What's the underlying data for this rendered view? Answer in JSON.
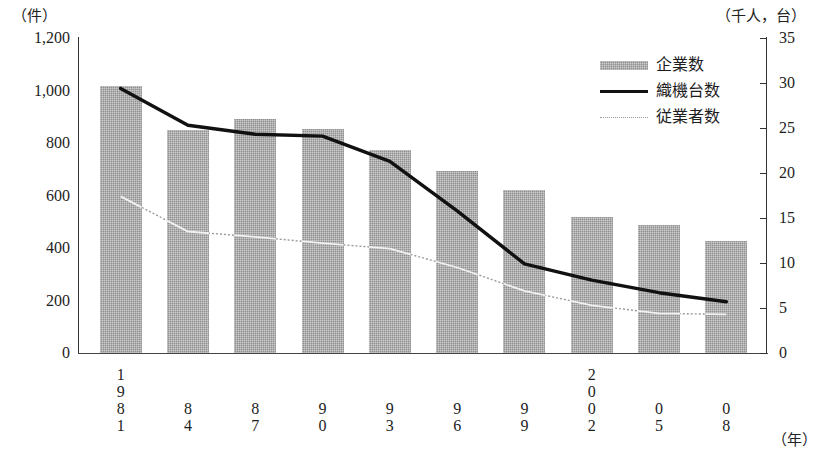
{
  "axes": {
    "left_unit": "（件）",
    "right_unit": "（千人，台）",
    "x_unit": "（年）",
    "left_ticks": [
      "1,200",
      "1,000",
      "800",
      "600",
      "400",
      "200",
      "0"
    ],
    "right_ticks": [
      "35",
      "30",
      "25",
      "20",
      "15",
      "10",
      "5",
      "0"
    ]
  },
  "legend": {
    "items": [
      {
        "key": "bar-swatch",
        "label": "企業数"
      },
      {
        "key": "solid-line",
        "label": "織機台数"
      },
      {
        "key": "dotted-line",
        "label": "従業者数"
      }
    ]
  },
  "xlabels": [
    {
      "digits": [
        "1",
        "9",
        "8",
        "1"
      ]
    },
    {
      "digits": [
        "8",
        "4"
      ]
    },
    {
      "digits": [
        "8",
        "7"
      ]
    },
    {
      "digits": [
        "9",
        "0"
      ]
    },
    {
      "digits": [
        "9",
        "3"
      ]
    },
    {
      "digits": [
        "9",
        "6"
      ]
    },
    {
      "digits": [
        "9",
        "9"
      ]
    },
    {
      "digits": [
        "2",
        "0",
        "0",
        "2"
      ]
    },
    {
      "digits": [
        "0",
        "5"
      ]
    },
    {
      "digits": [
        "0",
        "8"
      ]
    }
  ],
  "colors": {
    "bar_fill": "#8f8f8f",
    "loom_line": "#111111",
    "employee_line": "#9a9a9a",
    "employee_line_over_bar": "#f2f2f2",
    "axis": "#333333"
  },
  "chart_data": {
    "type": "bar",
    "title": "",
    "xlabel": "（年）",
    "ylabel": "（件）",
    "y2label": "（千人，台）",
    "ylim": [
      0,
      1200
    ],
    "y2lim": [
      0,
      35
    ],
    "grid": false,
    "legend_position": "top-right",
    "categories": [
      "1981",
      "84",
      "87",
      "90",
      "93",
      "96",
      "99",
      "2002",
      "05",
      "08"
    ],
    "series": [
      {
        "name": "企業数",
        "type": "bar",
        "axis": "left",
        "unit": "件",
        "values": [
          1017,
          850,
          890,
          855,
          775,
          695,
          620,
          520,
          488,
          428
        ]
      },
      {
        "name": "織機台数",
        "type": "line",
        "axis": "right",
        "unit": "台（千）",
        "values": [
          29.4,
          25.3,
          24.3,
          24.1,
          21.3,
          15.8,
          9.9,
          8.1,
          6.7,
          5.7
        ]
      },
      {
        "name": "従業者数",
        "type": "line",
        "axis": "right",
        "unit": "千人",
        "values": [
          17.4,
          13.5,
          12.9,
          12.2,
          11.6,
          9.5,
          6.9,
          5.3,
          4.4,
          4.3
        ]
      }
    ]
  }
}
